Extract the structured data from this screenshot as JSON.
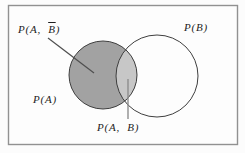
{
  "figure": {
    "type": "venn-diagram",
    "labels": {
      "top_left": {
        "prefix": "P(A,  ",
        "barred": "B",
        "suffix": ")"
      },
      "top_right": "P(B)",
      "left": "P(A)",
      "bottom": "P(A,  B)"
    },
    "colors": {
      "left_region_fill": "#a2a2a2",
      "intersection_fill": "#c7c7c7",
      "circle_outline": "#3f3f3f",
      "frame_border": "#919191",
      "background": "#fdfdfd",
      "leader_line": "#4f4f4f",
      "intersection_pointer_line": "#8e8e8e"
    }
  }
}
